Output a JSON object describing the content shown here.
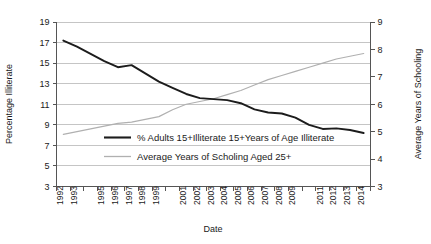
{
  "chart_data": {
    "type": "line",
    "title": "",
    "xlabel": "Date",
    "ylabel": "Percentage Illiterate",
    "y2label": "Average Years of Schooling",
    "grid": true,
    "legend_position": "inside-center",
    "x": [
      1992,
      1993,
      1994,
      1995,
      1996,
      1997,
      1998,
      1999,
      2000,
      2001,
      2002,
      2003,
      2004,
      2005,
      2006,
      2007,
      2008,
      2009,
      2010,
      2011,
      2012,
      2013,
      2014
    ],
    "xtick_labels": [
      "1992",
      "1993",
      "1995",
      "1996",
      "1997",
      "1998",
      "1999",
      "2001",
      "2002",
      "2003",
      "2004",
      "2005",
      "2006",
      "2007",
      "2008",
      "2009",
      "2011",
      "2012",
      "2013",
      "2014"
    ],
    "xtick_values": [
      1992,
      1993,
      1995,
      1996,
      1997,
      1998,
      1999,
      2001,
      2002,
      2003,
      2004,
      2005,
      2006,
      2007,
      2008,
      2009,
      2011,
      2012,
      2013,
      2014
    ],
    "ylim": [
      3,
      19
    ],
    "ytick_labels": [
      "3",
      "5",
      "7",
      "9",
      "11",
      "13",
      "15",
      "17",
      "19"
    ],
    "ytick_values": [
      3,
      5,
      7,
      9,
      11,
      13,
      15,
      17,
      19
    ],
    "y2lim": [
      3,
      9
    ],
    "y2tick_labels": [
      "3",
      "4",
      "5",
      "6",
      "7",
      "8",
      "9"
    ],
    "y2tick_values": [
      3,
      4,
      5,
      6,
      7,
      8,
      9
    ],
    "series": [
      {
        "name": "% Adults 15+Illiterate 15+Years of Age Illiterate",
        "axis": "left",
        "color": "#1c1c1c",
        "values": [
          17.2,
          16.6,
          15.9,
          15.2,
          14.6,
          14.8,
          14.0,
          13.2,
          12.6,
          12.0,
          11.6,
          11.5,
          11.4,
          11.1,
          10.5,
          10.2,
          10.1,
          9.7,
          9.0,
          8.6,
          8.65,
          8.5,
          8.2
        ]
      },
      {
        "name": "Average Years of Scholing Aged 25+",
        "axis": "right",
        "color": "#b0b0b0",
        "values": [
          4.9,
          5.0,
          5.1,
          5.2,
          5.3,
          5.35,
          5.45,
          5.55,
          5.8,
          6.0,
          6.1,
          6.2,
          6.35,
          6.5,
          6.7,
          6.9,
          7.05,
          7.2,
          7.35,
          7.5,
          7.65,
          7.75,
          7.85
        ]
      }
    ]
  },
  "legend": {
    "items": [
      {
        "label": "% Adults 15+Illiterate 15+Years of Age Illiterate",
        "swatch": "dark-line-swatch"
      },
      {
        "label": "Average Years of Scholing Aged 25+",
        "swatch": "light-line-swatch"
      }
    ]
  },
  "colors": {
    "illiteracy_line": "#1c1c1c",
    "schooling_line": "#b0b0b0",
    "gridline": "#b7b7b7",
    "axis": "#555555",
    "background": "#ffffff"
  }
}
